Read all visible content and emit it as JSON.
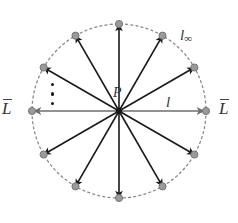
{
  "figure": {
    "background_color": "#ffffff",
    "canvas": {
      "width": 238,
      "height": 223
    }
  },
  "geometry": {
    "center": {
      "x": 119,
      "y": 111
    },
    "radius": 87,
    "ray_count": 12,
    "ray_angles_deg": [
      0,
      30,
      60,
      90,
      120,
      150,
      180,
      210,
      240,
      270,
      300,
      330
    ]
  },
  "style": {
    "circle_stroke": "#8a8a8a",
    "circle_dash": "2,3.2",
    "ray_stroke": "#1a1a1a",
    "ray_width": 1.6,
    "axis_stroke": "#6e6e6e",
    "axis_width": 1.7,
    "node_fill": "#9a9a9a",
    "node_stroke": "#6f6f6f",
    "node_radius": 3.6,
    "text_color": "#333333"
  },
  "labels": {
    "point_center": "P",
    "line_horizontal": "l",
    "line_at_infinity_base": "l",
    "line_at_infinity_sub": "∞",
    "endpoint_left": "L",
    "endpoint_right": "L",
    "ellipsis": "⋮"
  }
}
